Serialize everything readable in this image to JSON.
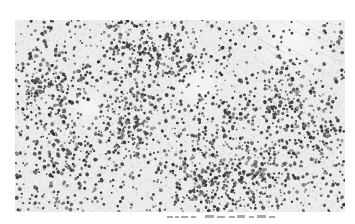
{
  "figure": {
    "type": "histology-micrograph",
    "stain_appearance": "grayscale",
    "colors": {
      "background": "#ffffff",
      "tissue_background": "#ececec",
      "stroma_light": "#f4f4f4",
      "nucleus_dark": "#3a3a3a",
      "nucleus_mid": "#6e6e6e",
      "caption": "#9a9a9a"
    },
    "micrograph": {
      "x": 15,
      "y": 20,
      "width": 330,
      "height": 192,
      "density_regions": [
        {
          "cx": 0.1,
          "cy": 0.35,
          "r": 0.14,
          "density": 0.9
        },
        {
          "cx": 0.33,
          "cy": 0.18,
          "r": 0.12,
          "density": 0.85
        },
        {
          "cx": 0.47,
          "cy": 0.2,
          "r": 0.1,
          "density": 0.8
        },
        {
          "cx": 0.35,
          "cy": 0.55,
          "r": 0.14,
          "density": 0.75
        },
        {
          "cx": 0.15,
          "cy": 0.72,
          "r": 0.12,
          "density": 0.7
        },
        {
          "cx": 0.58,
          "cy": 0.82,
          "r": 0.14,
          "density": 0.95
        },
        {
          "cx": 0.75,
          "cy": 0.8,
          "r": 0.13,
          "density": 0.9
        },
        {
          "cx": 0.8,
          "cy": 0.4,
          "r": 0.12,
          "density": 0.75
        },
        {
          "cx": 0.9,
          "cy": 0.6,
          "r": 0.1,
          "density": 0.7
        },
        {
          "cx": 0.62,
          "cy": 0.5,
          "r": 0.1,
          "density": 0.6
        }
      ],
      "pale_regions": [
        {
          "cx": 0.85,
          "cy": 0.08,
          "r": 0.15
        },
        {
          "cx": 0.55,
          "cy": 0.35,
          "r": 0.08
        },
        {
          "cx": 0.22,
          "cy": 0.45,
          "r": 0.06
        }
      ]
    },
    "caption": {
      "text": "",
      "note": "caption clipped at image bottom edge; glyphs illegible"
    }
  }
}
